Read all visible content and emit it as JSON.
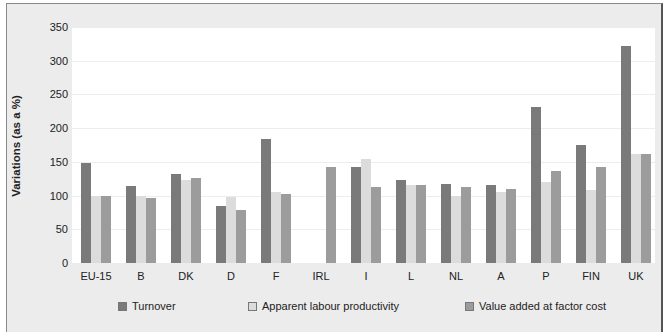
{
  "chart_data": {
    "type": "bar",
    "title": "",
    "xlabel": "",
    "ylabel": "Variations (as a %)",
    "ylim": [
      0,
      350
    ],
    "yticks": [
      0,
      50,
      100,
      150,
      200,
      250,
      300,
      350
    ],
    "grid": true,
    "legend_position": "bottom",
    "categories": [
      "EU-15",
      "B",
      "DK",
      "D",
      "F",
      "IRL",
      "I",
      "L",
      "NL",
      "A",
      "P",
      "FIN",
      "UK"
    ],
    "series": [
      {
        "name": "Turnover",
        "color": "#7a7a7a",
        "values": [
          148,
          114,
          132,
          85,
          184,
          0,
          142,
          123,
          117,
          116,
          232,
          175,
          322
        ]
      },
      {
        "name": "Apparent labour productivity",
        "color": "#dcdcdc",
        "values": [
          100,
          100,
          123,
          98,
          106,
          0,
          154,
          115,
          100,
          105,
          120,
          108,
          162
        ]
      },
      {
        "name": "Value added at factor cost",
        "color": "#9c9c9c",
        "values": [
          100,
          96,
          126,
          78,
          103,
          142,
          112,
          116,
          112,
          110,
          137,
          143,
          161
        ]
      }
    ]
  }
}
